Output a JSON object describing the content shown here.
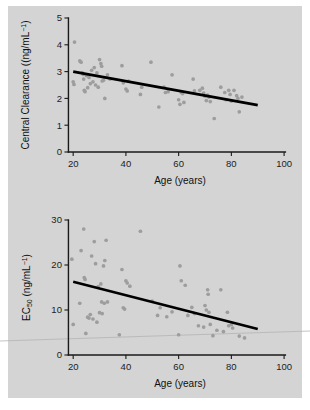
{
  "figure": {
    "background_color": "#d4d4d4",
    "point_color": "#9d9d9d",
    "line_color": "#000000",
    "panel_count": 2
  },
  "chart_data": [
    {
      "type": "scatter",
      "panel": "top",
      "title": "",
      "xlabel": "Age (years)",
      "ylabel": "Central Clearance ((ng/mL⁻¹)",
      "ylabel_main": "Central Clearance ((ng/mL",
      "ylabel_exponent": "−1",
      "ylabel_tail": ")",
      "xlim": [
        15,
        103
      ],
      "ylim": [
        0,
        5
      ],
      "xticks": [
        20,
        40,
        60,
        80,
        100
      ],
      "yticks": [
        0,
        1,
        2,
        3,
        4,
        5
      ],
      "grid": false,
      "legend": "none",
      "fit_line": {
        "x": [
          20,
          90
        ],
        "y": [
          3.0,
          1.75
        ],
        "label": "linear regression"
      },
      "points": [
        {
          "x": 20.5,
          "y": 4.1
        },
        {
          "x": 20.0,
          "y": 2.62
        },
        {
          "x": 20.3,
          "y": 2.52
        },
        {
          "x": 22.5,
          "y": 3.4
        },
        {
          "x": 23.0,
          "y": 3.35
        },
        {
          "x": 23.5,
          "y": 2.95
        },
        {
          "x": 23.8,
          "y": 2.9
        },
        {
          "x": 24.0,
          "y": 2.72
        },
        {
          "x": 24.2,
          "y": 2.3
        },
        {
          "x": 24.5,
          "y": 2.25
        },
        {
          "x": 25.0,
          "y": 2.85
        },
        {
          "x": 25.5,
          "y": 2.4
        },
        {
          "x": 26.0,
          "y": 2.78
        },
        {
          "x": 26.5,
          "y": 2.55
        },
        {
          "x": 27.0,
          "y": 3.05
        },
        {
          "x": 27.5,
          "y": 2.62
        },
        {
          "x": 28.0,
          "y": 3.15
        },
        {
          "x": 28.5,
          "y": 2.5
        },
        {
          "x": 29.0,
          "y": 2.95
        },
        {
          "x": 29.5,
          "y": 2.42
        },
        {
          "x": 30.0,
          "y": 3.45
        },
        {
          "x": 30.5,
          "y": 3.3
        },
        {
          "x": 30.8,
          "y": 3.2
        },
        {
          "x": 31.0,
          "y": 2.65
        },
        {
          "x": 31.5,
          "y": 2.68
        },
        {
          "x": 32.0,
          "y": 2.0
        },
        {
          "x": 33.0,
          "y": 2.88
        },
        {
          "x": 34.0,
          "y": 2.72
        },
        {
          "x": 38.5,
          "y": 3.22
        },
        {
          "x": 39.0,
          "y": 2.58
        },
        {
          "x": 40.0,
          "y": 2.35
        },
        {
          "x": 40.5,
          "y": 2.28
        },
        {
          "x": 41.0,
          "y": 2.65
        },
        {
          "x": 45.5,
          "y": 2.15
        },
        {
          "x": 46.0,
          "y": 2.42
        },
        {
          "x": 49.5,
          "y": 3.35
        },
        {
          "x": 52.5,
          "y": 1.68
        },
        {
          "x": 54.5,
          "y": 2.42
        },
        {
          "x": 55.0,
          "y": 2.22
        },
        {
          "x": 56.0,
          "y": 2.25
        },
        {
          "x": 57.5,
          "y": 2.88
        },
        {
          "x": 60.0,
          "y": 1.95
        },
        {
          "x": 60.5,
          "y": 1.78
        },
        {
          "x": 61.0,
          "y": 2.22
        },
        {
          "x": 61.5,
          "y": 2.18
        },
        {
          "x": 62.0,
          "y": 1.85
        },
        {
          "x": 65.5,
          "y": 2.72
        },
        {
          "x": 66.0,
          "y": 2.28
        },
        {
          "x": 68.0,
          "y": 2.3
        },
        {
          "x": 69.0,
          "y": 2.38
        },
        {
          "x": 69.5,
          "y": 2.2
        },
        {
          "x": 70.0,
          "y": 2.08
        },
        {
          "x": 70.5,
          "y": 1.92
        },
        {
          "x": 71.0,
          "y": 2.12
        },
        {
          "x": 71.5,
          "y": 2.05
        },
        {
          "x": 72.0,
          "y": 1.88
        },
        {
          "x": 73.5,
          "y": 1.25
        },
        {
          "x": 76.0,
          "y": 2.42
        },
        {
          "x": 77.5,
          "y": 2.22
        },
        {
          "x": 78.0,
          "y": 1.95
        },
        {
          "x": 79.0,
          "y": 2.3
        },
        {
          "x": 79.5,
          "y": 2.15
        },
        {
          "x": 80.0,
          "y": 1.9
        },
        {
          "x": 81.0,
          "y": 2.3
        },
        {
          "x": 82.0,
          "y": 2.1
        },
        {
          "x": 82.5,
          "y": 2.0
        },
        {
          "x": 83.0,
          "y": 1.5
        },
        {
          "x": 84.0,
          "y": 2.05
        }
      ]
    },
    {
      "type": "scatter",
      "panel": "bottom",
      "title": "",
      "xlabel": "Age (years)",
      "ylabel": "EC50 (ng/mL⁻¹)",
      "ylabel_main": "EC",
      "ylabel_subscript": "50",
      "ylabel_unit": " (ng/mL",
      "ylabel_exponent": "−1",
      "ylabel_tail": ")",
      "xlim": [
        15,
        103
      ],
      "ylim": [
        0,
        30
      ],
      "xticks": [
        20,
        40,
        60,
        80,
        100
      ],
      "yticks": [
        0,
        10,
        20,
        30
      ],
      "grid": false,
      "legend": "none",
      "fit_line": {
        "x": [
          20,
          90
        ],
        "y": [
          16.3,
          5.8
        ],
        "label": "linear regression"
      },
      "points": [
        {
          "x": 19.5,
          "y": 21.3
        },
        {
          "x": 20.0,
          "y": 6.8
        },
        {
          "x": 22.5,
          "y": 11.5
        },
        {
          "x": 23.0,
          "y": 23.2
        },
        {
          "x": 24.0,
          "y": 28.0
        },
        {
          "x": 24.2,
          "y": 17.2
        },
        {
          "x": 24.5,
          "y": 16.8
        },
        {
          "x": 24.8,
          "y": 4.8
        },
        {
          "x": 25.5,
          "y": 8.4
        },
        {
          "x": 26.0,
          "y": 8.2
        },
        {
          "x": 26.5,
          "y": 9.0
        },
        {
          "x": 27.0,
          "y": 22.0
        },
        {
          "x": 27.5,
          "y": 8.0
        },
        {
          "x": 28.0,
          "y": 25.2
        },
        {
          "x": 28.5,
          "y": 20.3
        },
        {
          "x": 29.0,
          "y": 7.3
        },
        {
          "x": 29.5,
          "y": 15.2
        },
        {
          "x": 30.0,
          "y": 9.4
        },
        {
          "x": 30.5,
          "y": 15.8
        },
        {
          "x": 30.8,
          "y": 11.8
        },
        {
          "x": 31.0,
          "y": 9.2
        },
        {
          "x": 31.5,
          "y": 19.8
        },
        {
          "x": 31.8,
          "y": 11.5
        },
        {
          "x": 32.0,
          "y": 21.0
        },
        {
          "x": 32.5,
          "y": 25.5
        },
        {
          "x": 33.0,
          "y": 11.8
        },
        {
          "x": 37.5,
          "y": 4.5
        },
        {
          "x": 38.5,
          "y": 19.0
        },
        {
          "x": 39.0,
          "y": 10.5
        },
        {
          "x": 39.5,
          "y": 10.2
        },
        {
          "x": 40.0,
          "y": 16.5
        },
        {
          "x": 40.5,
          "y": 16.0
        },
        {
          "x": 41.5,
          "y": 15.3
        },
        {
          "x": 45.5,
          "y": 27.5
        },
        {
          "x": 50.0,
          "y": 12.0
        },
        {
          "x": 52.0,
          "y": 8.8
        },
        {
          "x": 53.0,
          "y": 10.5
        },
        {
          "x": 55.5,
          "y": 8.5
        },
        {
          "x": 57.5,
          "y": 9.6
        },
        {
          "x": 60.0,
          "y": 4.5
        },
        {
          "x": 60.5,
          "y": 19.8
        },
        {
          "x": 61.0,
          "y": 16.5
        },
        {
          "x": 62.5,
          "y": 15.5
        },
        {
          "x": 63.5,
          "y": 8.8
        },
        {
          "x": 65.0,
          "y": 10.6
        },
        {
          "x": 66.0,
          "y": 9.2
        },
        {
          "x": 67.5,
          "y": 6.5
        },
        {
          "x": 69.5,
          "y": 6.2
        },
        {
          "x": 70.0,
          "y": 11.0
        },
        {
          "x": 70.5,
          "y": 10.0
        },
        {
          "x": 71.0,
          "y": 14.5
        },
        {
          "x": 71.2,
          "y": 13.5
        },
        {
          "x": 71.5,
          "y": 9.5
        },
        {
          "x": 72.0,
          "y": 6.8
        },
        {
          "x": 73.0,
          "y": 4.3
        },
        {
          "x": 74.5,
          "y": 5.5
        },
        {
          "x": 76.0,
          "y": 14.5
        },
        {
          "x": 77.0,
          "y": 5.2
        },
        {
          "x": 78.5,
          "y": 9.5
        },
        {
          "x": 79.0,
          "y": 6.5
        },
        {
          "x": 80.0,
          "y": 6.8
        },
        {
          "x": 80.5,
          "y": 6.0
        },
        {
          "x": 83.0,
          "y": 4.2
        },
        {
          "x": 85.0,
          "y": 3.8
        }
      ]
    }
  ]
}
